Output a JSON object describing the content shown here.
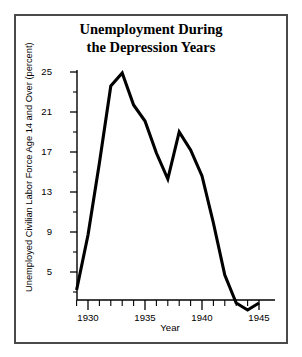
{
  "figure": {
    "background_color": "#ffffff",
    "border_color": "#4a4a4a",
    "line_color": "#000000"
  },
  "title_lines": [
    "Unemployment During",
    "the Depression Years"
  ],
  "chart_data": {
    "type": "line",
    "title": "Unemployment During the Depression Years",
    "xlabel": "Year",
    "ylabel": "Unemployed Civilian Labor Force Age 14 and Over (percent)",
    "xlim": [
      1928.3,
      1945.6
    ],
    "ylim": [
      0.6,
      25.9
    ],
    "grid": false,
    "legend": null,
    "x_major_ticks": [
      1930,
      1935,
      1940,
      1945
    ],
    "x_major_tick_labels": [
      "1930",
      "1935",
      "1940",
      "1945"
    ],
    "x_minor_ticks": [
      1929,
      1931,
      1932,
      1933,
      1934,
      1936,
      1937,
      1938,
      1939,
      1941,
      1942,
      1943,
      1944
    ],
    "y_major_ticks": [
      5,
      9,
      13,
      17,
      21,
      25
    ],
    "y_major_tick_labels": [
      "5",
      "9",
      "13",
      "17",
      "21",
      "25"
    ],
    "y_minor_ticks": [
      3,
      7,
      11,
      15,
      19,
      23
    ],
    "x": [
      1929,
      1930,
      1931,
      1932,
      1933,
      1934,
      1935,
      1936,
      1937,
      1938,
      1939,
      1940,
      1941,
      1942,
      1943,
      1944,
      1945
    ],
    "values": [
      3.2,
      8.7,
      15.9,
      23.6,
      24.9,
      21.7,
      20.1,
      16.9,
      14.3,
      19.0,
      17.2,
      14.6,
      9.9,
      4.7,
      1.9,
      1.2,
      1.9
    ],
    "series": [
      {
        "name": "Unemployment rate",
        "values": [
          3.2,
          8.7,
          15.9,
          23.6,
          24.9,
          21.7,
          20.1,
          16.9,
          14.3,
          19.0,
          17.2,
          14.6,
          9.9,
          4.7,
          1.9,
          1.2,
          1.9
        ]
      }
    ],
    "annotations": []
  }
}
